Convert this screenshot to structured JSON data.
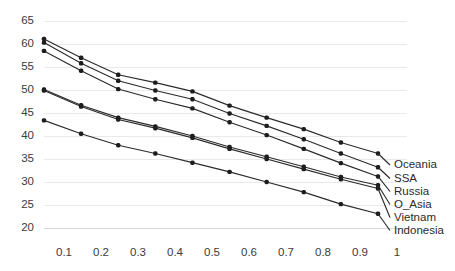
{
  "chart_data": {
    "type": "line",
    "title": "",
    "subtitle": "",
    "xlabel": "",
    "ylabel": "",
    "xlim": [
      0.05,
      1.05
    ],
    "ylim": [
      20,
      65
    ],
    "grid": true,
    "legend_position": "right-inline-labels",
    "x": [
      0.1,
      0.2,
      0.3,
      0.4,
      0.5,
      0.6,
      0.7,
      0.8,
      0.9,
      1.0
    ],
    "xticks": [
      "0.1",
      "0.2",
      "0.3",
      "0.4",
      "0.5",
      "0.6",
      "0.7",
      "0.8",
      "0.9",
      "1"
    ],
    "yticks": [
      "20",
      "25",
      "30",
      "35",
      "40",
      "45",
      "50",
      "55",
      "60",
      "65"
    ],
    "series": [
      {
        "name": "Oceania",
        "values": [
          61.1,
          57.0,
          53.3,
          51.6,
          49.7,
          46.6,
          44.0,
          41.5,
          38.6,
          36.2
        ]
      },
      {
        "name": "SSA",
        "values": [
          60.3,
          55.8,
          52.0,
          49.9,
          48.0,
          44.9,
          42.2,
          39.3,
          36.2,
          33.2
        ]
      },
      {
        "name": "Russia",
        "values": [
          58.5,
          54.2,
          50.2,
          48.0,
          46.0,
          43.0,
          40.2,
          37.2,
          34.1,
          31.2
        ]
      },
      {
        "name": "O_Asia",
        "values": [
          50.1,
          46.7,
          44.0,
          42.1,
          40.0,
          37.6,
          35.5,
          33.3,
          31.1,
          29.3
        ]
      },
      {
        "name": "Vietnam",
        "values": [
          49.9,
          46.4,
          43.6,
          41.7,
          39.6,
          37.2,
          35.0,
          32.8,
          30.6,
          28.6
        ]
      },
      {
        "name": "Indonesia",
        "values": [
          43.4,
          40.5,
          38.0,
          36.2,
          34.2,
          32.2,
          30.0,
          27.8,
          25.2,
          23.1
        ]
      }
    ]
  },
  "series_labels": {
    "oceania": "Oceania",
    "ssa": "SSA",
    "russia": "Russia",
    "o_asia": "O_Asia",
    "vietnam": "Vietnam",
    "indonesia": "Indonesia"
  },
  "colors": {
    "line": "#2b2b2b",
    "marker": "#1d1d1d",
    "grid": "#e9e9e9",
    "tick_text": "#3a3a3a",
    "background": "#ffffff"
  }
}
